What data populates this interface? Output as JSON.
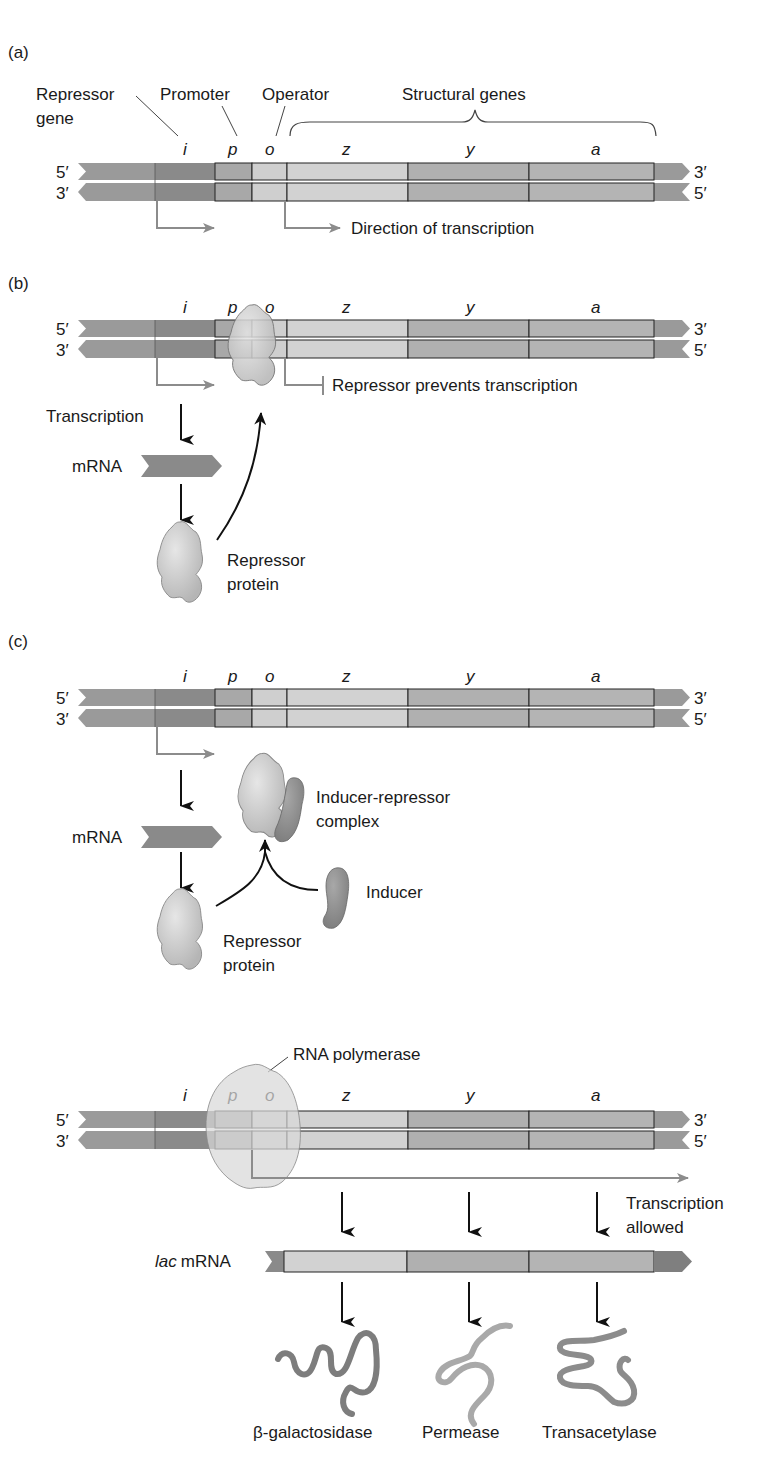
{
  "panels": {
    "a": {
      "label": "(a)",
      "callouts": {
        "repressor_gene_line1": "Repressor",
        "repressor_gene_line2": "gene",
        "promoter": "Promoter",
        "operator": "Operator",
        "structural_genes": "Structural genes"
      },
      "direction_label": "Direction of transcription"
    },
    "b": {
      "label": "(b)",
      "block_label": "Repressor prevents transcription",
      "transcription_label": "Transcription",
      "mrna_label": "mRNA",
      "repressor_line1": "Repressor",
      "repressor_line2": "protein"
    },
    "c": {
      "label": "(c)",
      "mrna_label": "mRNA",
      "complex_line1": "Inducer-repressor",
      "complex_line2": "complex",
      "inducer_label": "Inducer",
      "repressor_line1": "Repressor",
      "repressor_line2": "protein"
    },
    "d": {
      "polymerase_label": "RNA polymerase",
      "allowed_line1": "Transcription",
      "allowed_line2": "allowed",
      "lac_italic": "lac",
      "lac_mrna": "mRNA",
      "products": [
        "β-galactosidase",
        "Permease",
        "Transacetylase"
      ]
    }
  },
  "genes": [
    "i",
    "p",
    "o",
    "z",
    "y",
    "a"
  ],
  "strand_ends": {
    "top_left": "5′",
    "top_right": "3′",
    "bottom_left": "3′",
    "bottom_right": "5′"
  },
  "colors": {
    "i": "#8a8a8a",
    "p": "#a8a8a8",
    "o": "#cfcfcf",
    "z": "#d2d2d2",
    "y": "#b0b0b0",
    "a": "#b4b4b4",
    "flank": "#9a9a9a",
    "arrow_gray": "#8c8c8c",
    "protein": "#c8c8c8",
    "inducer": "#8f8f8f"
  }
}
